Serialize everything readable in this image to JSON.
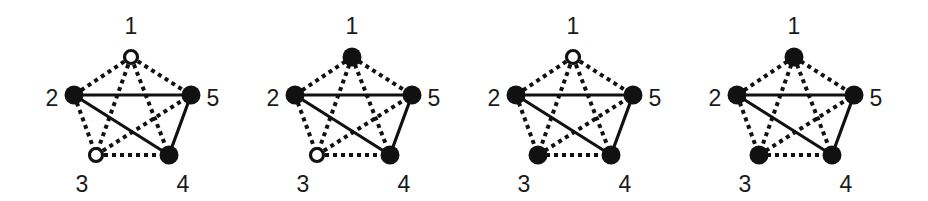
{
  "figure": {
    "style": {
      "node_color": "#111111",
      "edge_color": "#111111",
      "label_color": "#1a1a1a",
      "background": "#ffffff"
    },
    "node_labels": [
      "1",
      "2",
      "3",
      "4",
      "5"
    ],
    "solid_edges": [
      [
        2,
        5
      ],
      [
        2,
        4
      ],
      [
        5,
        4
      ]
    ],
    "dashed_edges": [
      [
        1,
        2
      ],
      [
        1,
        5
      ],
      [
        1,
        3
      ],
      [
        1,
        4
      ],
      [
        2,
        3
      ],
      [
        3,
        5
      ],
      [
        3,
        4
      ]
    ],
    "graphs": [
      {
        "id": "graph-1",
        "offset_x": 0,
        "nodes": {
          "1": {
            "state": "open"
          },
          "2": {
            "state": "filled"
          },
          "3": {
            "state": "open"
          },
          "4": {
            "state": "filled"
          },
          "5": {
            "state": "filled"
          }
        }
      },
      {
        "id": "graph-2",
        "offset_x": 221,
        "nodes": {
          "1": {
            "state": "filled"
          },
          "2": {
            "state": "filled"
          },
          "3": {
            "state": "open"
          },
          "4": {
            "state": "filled"
          },
          "5": {
            "state": "filled"
          }
        }
      },
      {
        "id": "graph-3",
        "offset_x": 442,
        "nodes": {
          "1": {
            "state": "open"
          },
          "2": {
            "state": "filled"
          },
          "3": {
            "state": "filled"
          },
          "4": {
            "state": "filled"
          },
          "5": {
            "state": "filled"
          }
        }
      },
      {
        "id": "graph-4",
        "offset_x": 663,
        "nodes": {
          "1": {
            "state": "filled"
          },
          "2": {
            "state": "filled"
          },
          "3": {
            "state": "filled"
          },
          "4": {
            "state": "filled"
          },
          "5": {
            "state": "filled"
          }
        }
      }
    ],
    "base_layout": {
      "nodes": {
        "1": {
          "x": 131,
          "y": 57,
          "label_x": 131,
          "label_y": 28
        },
        "2": {
          "x": 74,
          "y": 95,
          "label_x": 52,
          "label_y": 100
        },
        "3": {
          "x": 96,
          "y": 155,
          "label_x": 82,
          "label_y": 186
        },
        "4": {
          "x": 169,
          "y": 155,
          "label_x": 183,
          "label_y": 186
        },
        "5": {
          "x": 191,
          "y": 95,
          "label_x": 213,
          "label_y": 100
        }
      }
    }
  }
}
